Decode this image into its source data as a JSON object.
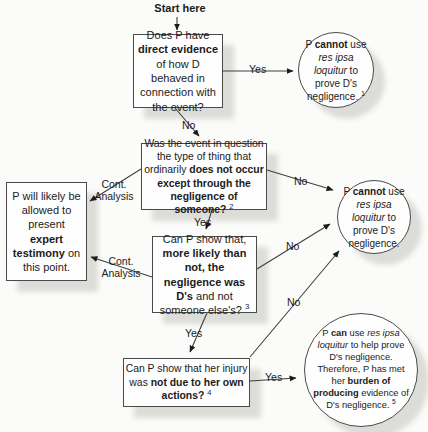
{
  "colors": {
    "background": "#fbfbf9",
    "node_border": "#4a4a4a",
    "line": "#3f3f3f",
    "text": "#1b1b1b",
    "shadow": "rgba(60,60,50,0.16)"
  },
  "start_label": "Start here",
  "nodes": {
    "q_direct_evidence": {
      "shape": "rect",
      "segments": [
        {
          "t": "Does P have "
        },
        {
          "t": "direct evidence",
          "b": true
        },
        {
          "t": " of how D behaved in connection with the event?"
        }
      ]
    },
    "r_cannot_1": {
      "shape": "circle",
      "segments": [
        {
          "t": "P "
        },
        {
          "t": "cannot",
          "b": true
        },
        {
          "t": " use "
        },
        {
          "t": "res ipsa loquitur",
          "i": true
        },
        {
          "t": " to prove D's negligence. "
        },
        {
          "t": "1",
          "sup": true
        }
      ]
    },
    "q_ordinary_occurrence": {
      "shape": "rect",
      "segments": [
        {
          "t": "Was the event in question the type of thing that ordinarily "
        },
        {
          "t": "does not occur except through the negligence of someone?",
          "b": true
        },
        {
          "t": " "
        },
        {
          "t": "2",
          "sup": true
        }
      ]
    },
    "r_expert_testimony": {
      "shape": "rect",
      "segments": [
        {
          "t": "P will likely be allowed to present "
        },
        {
          "t": "expert testimony",
          "b": true
        },
        {
          "t": " on this point."
        }
      ]
    },
    "q_more_likely": {
      "shape": "rect",
      "segments": [
        {
          "t": "Can P show that, "
        },
        {
          "t": "more likely than not, the negligence was D's",
          "b": true
        },
        {
          "t": " and not someone else's? "
        },
        {
          "t": "3",
          "sup": true
        }
      ]
    },
    "r_cannot_2": {
      "shape": "circle",
      "segments": [
        {
          "t": "P "
        },
        {
          "t": "cannot",
          "b": true
        },
        {
          "t": " use "
        },
        {
          "t": "res ipsa loquitur",
          "i": true
        },
        {
          "t": " to prove D's negligence."
        }
      ]
    },
    "q_own_actions": {
      "shape": "rect",
      "segments": [
        {
          "t": "Can P show that her injury was "
        },
        {
          "t": "not due to her own actions?",
          "b": true
        },
        {
          "t": " "
        },
        {
          "t": "4",
          "sup": true
        }
      ]
    },
    "r_can_use": {
      "shape": "circle",
      "segments": [
        {
          "t": "P "
        },
        {
          "t": "can",
          "b": true
        },
        {
          "t": " use "
        },
        {
          "t": "res ipsa loquitur",
          "i": true
        },
        {
          "t": " to help prove D's negligence. Therefore, P has met her "
        },
        {
          "t": "burden of producing",
          "b": true
        },
        {
          "t": " evidence of D's negligence. "
        },
        {
          "t": "5",
          "sup": true
        }
      ]
    }
  },
  "edge_labels": {
    "yes_direct": "Yes",
    "no_direct": "No",
    "no_ordinary": "No",
    "cont_analysis_1": "Cont. Analysis",
    "yes_ordinary": "Yes",
    "cont_analysis_2": "Cont. Analysis",
    "no_more_likely": "No",
    "yes_more_likely": "Yes",
    "no_own_actions": "No",
    "yes_own_actions": "Yes"
  }
}
